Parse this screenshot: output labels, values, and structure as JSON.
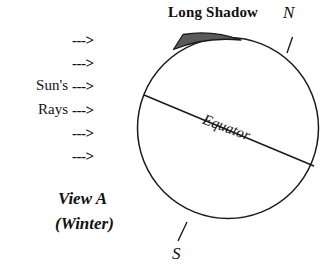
{
  "figure": {
    "type": "diagram",
    "background_color": "#ffffff",
    "line_color": "#1a1a1a"
  },
  "labels": {
    "long_shadow": "Long Shadow",
    "north_pole": "N",
    "south_pole": "S",
    "equator": "Equator",
    "view": "View A",
    "season": "(Winter)"
  },
  "sun_rays": {
    "word_suns": "Sun's",
    "word_rays": "Rays",
    "arrow_glyph": "--->",
    "arrow_count": 6,
    "arrows": [
      {
        "glyph": "--->",
        "y": 33
      },
      {
        "glyph": "--->",
        "y": 56
      },
      {
        "glyph": "--->",
        "y": 79
      },
      {
        "glyph": "--->",
        "y": 103
      },
      {
        "glyph": "--->",
        "y": 126
      },
      {
        "glyph": "--->",
        "y": 149
      }
    ]
  },
  "geometry": {
    "earth_circle": {
      "cx": 228,
      "cy": 128,
      "r": 90.5
    },
    "equator_line": {
      "x1": 144,
      "y1": 95,
      "x2": 314,
      "y2": 166
    },
    "north_tick": {
      "x1": 286,
      "y1": 52,
      "x2": 292,
      "y2": 38
    },
    "south_tick": {
      "x1": 186,
      "y1": 224,
      "x2": 178,
      "y2": 241
    },
    "shadow_wedge": "thin sliver along upper-left arc with apex at lower left"
  }
}
